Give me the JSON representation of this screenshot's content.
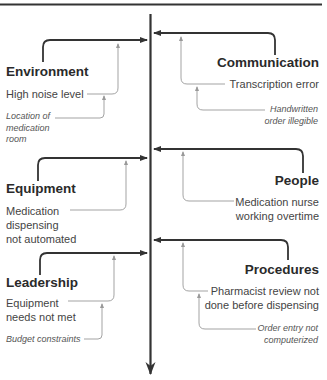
{
  "diagram": {
    "type": "fishbone",
    "colors": {
      "main_line": "#333333",
      "secondary_line": "#999999",
      "background": "#ffffff"
    },
    "categories": [
      {
        "name": "Environment",
        "side": "left",
        "cause": "High noise level",
        "sub_cause": "Location of medication room"
      },
      {
        "name": "Communication",
        "side": "right",
        "cause": "Transcription error",
        "sub_cause": "Handwritten order illegible"
      },
      {
        "name": "Equipment",
        "side": "left",
        "cause": "Medication dispensing not automated",
        "sub_cause": ""
      },
      {
        "name": "People",
        "side": "right",
        "cause": "Medication nurse working overtime",
        "sub_cause": ""
      },
      {
        "name": "Leadership",
        "side": "left",
        "cause": "Equipment needs not met",
        "sub_cause": "Budget constraints"
      },
      {
        "name": "Procedures",
        "side": "right",
        "cause": "Pharmacist review not done before dispensing",
        "sub_cause": "Order entry not computerized"
      }
    ]
  },
  "labels": {
    "environment": {
      "title": "Environment",
      "cause": "High noise level",
      "sub_l1": "Location of",
      "sub_l2": "medication",
      "sub_l3": "room"
    },
    "communication": {
      "title": "Communication",
      "cause": "Transcription error",
      "sub_l1": "Handwritten",
      "sub_l2": "order illegible"
    },
    "equipment": {
      "title": "Equipment",
      "cause_l1": "Medication",
      "cause_l2": "dispensing",
      "cause_l3": "not automated"
    },
    "people": {
      "title": "People",
      "cause_l1": "Medication nurse",
      "cause_l2": "working overtime"
    },
    "leadership": {
      "title": "Leadership",
      "cause_l1": "Equipment",
      "cause_l2": "needs not met",
      "sub": "Budget constraints"
    },
    "procedures": {
      "title": "Procedures",
      "cause_l1": "Pharmacist review not",
      "cause_l2": "done before dispensing",
      "sub_l1": "Order entry not",
      "sub_l2": "computerized"
    }
  }
}
